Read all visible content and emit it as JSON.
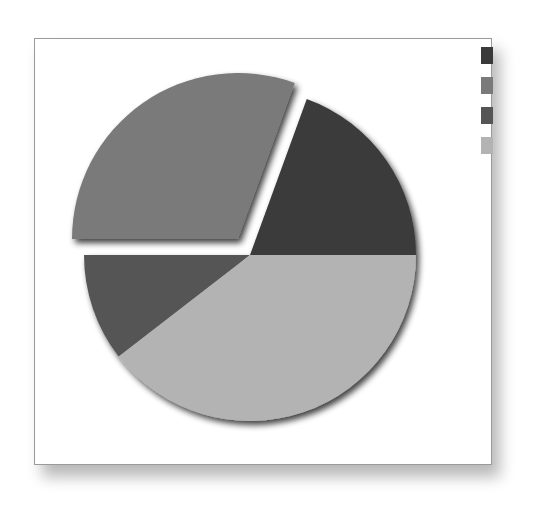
{
  "chart_data": {
    "type": "pie",
    "title": "",
    "exploded_index": 1,
    "series": [
      {
        "name": "",
        "value": 19.4,
        "color": "#3a3a3a",
        "start_deg": 0,
        "end_deg": 70
      },
      {
        "name": "",
        "value": 30.6,
        "color": "#7a7a7a",
        "start_deg": 70,
        "end_deg": 180
      },
      {
        "name": "",
        "value": 10.5,
        "color": "#555555",
        "start_deg": 180,
        "end_deg": 217.7
      },
      {
        "name": "",
        "value": 39.5,
        "color": "#b3b3b3",
        "start_deg": 217.7,
        "end_deg": 360
      }
    ],
    "legend": {
      "position": "top-right",
      "entries": [
        {
          "label": "",
          "color": "#3a3a3a"
        },
        {
          "label": "",
          "color": "#7a7a7a"
        },
        {
          "label": "",
          "color": "#555555"
        },
        {
          "label": "",
          "color": "#b3b3b3"
        }
      ]
    },
    "geometry": {
      "center": [
        250,
        255
      ],
      "radius": 166,
      "explode_offset": [
        -12,
        -16
      ]
    }
  }
}
